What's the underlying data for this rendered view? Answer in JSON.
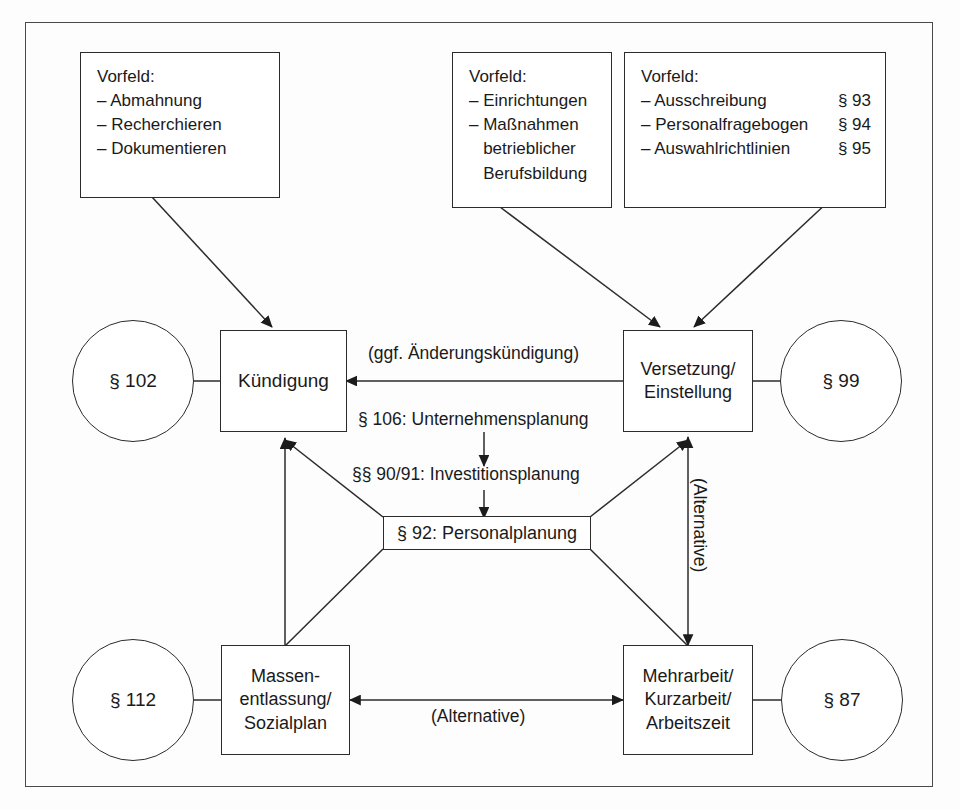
{
  "diagram": {
    "background_color": "#fdfdfd",
    "line_color": "#2b2b2b",
    "frame_color": "#4a4a4a"
  },
  "info_boxes": [
    {
      "id": "vorfeld-kuendigung",
      "title": "Vorfeld:",
      "rows": [
        {
          "text": "– Abmahnung",
          "ref": ""
        },
        {
          "text": "– Recherchieren",
          "ref": ""
        },
        {
          "text": "– Dokumentieren",
          "ref": ""
        }
      ]
    },
    {
      "id": "vorfeld-berufsbildung",
      "title": "Vorfeld:",
      "rows": [
        {
          "text": "– Einrichtungen",
          "ref": ""
        },
        {
          "text": "– Maßnahmen",
          "ref": ""
        },
        {
          "text": "   betrieblicher",
          "ref": ""
        },
        {
          "text": "   Berufsbildung",
          "ref": ""
        }
      ]
    },
    {
      "id": "vorfeld-einstellung",
      "title": "Vorfeld:",
      "rows": [
        {
          "text": "– Ausschreibung",
          "ref": "§ 93"
        },
        {
          "text": "– Personalfragebogen",
          "ref": "§ 94"
        },
        {
          "text": "– Auswahlrichtlinien",
          "ref": "§ 95"
        }
      ]
    }
  ],
  "nodes": [
    {
      "id": "kuendigung",
      "label": "Kündigung"
    },
    {
      "id": "versetzung",
      "label": "Versetzung/\nEinstellung"
    },
    {
      "id": "massenentlassung",
      "label": "Massen-\nentlassung/\nSozialplan"
    },
    {
      "id": "mehrarbeit",
      "label": "Mehrarbeit/\nKurzarbeit/\nArbeitszeit"
    }
  ],
  "plan_box": {
    "id": "personalplanung",
    "label": "§ 92: Personalplanung"
  },
  "circles": [
    {
      "id": "paragraph-102",
      "label": "§ 102"
    },
    {
      "id": "paragraph-99",
      "label": "§ 99"
    },
    {
      "id": "paragraph-112",
      "label": "§ 112"
    },
    {
      "id": "paragraph-87",
      "label": "§ 87"
    }
  ],
  "edge_labels": [
    {
      "id": "aenderungskuendigung",
      "text": "(ggf. Änderungskündigung)"
    },
    {
      "id": "unternehmensplanung",
      "text": "§ 106: Unternehmensplanung"
    },
    {
      "id": "investitionsplanung",
      "text": "§§ 90/91: Investitionsplanung"
    },
    {
      "id": "alternative-vertical",
      "text": "(Alternative)"
    },
    {
      "id": "alternative-horizontal",
      "text": "(Alternative)"
    }
  ]
}
